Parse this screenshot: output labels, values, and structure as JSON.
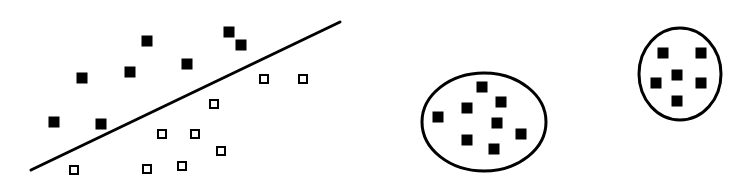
{
  "diagram": {
    "type": "classification-vs-clustering",
    "colors": {
      "stroke": "#000000",
      "fill": "#000000",
      "background": "#ffffff"
    },
    "square_size": 11,
    "hollow_square_size": 10,
    "classification": {
      "separator_line": {
        "x1": 31,
        "y1": 170,
        "x2": 340,
        "y2": 22,
        "stroke_width": 3
      },
      "filled_points": [
        [
          147,
          41
        ],
        [
          229,
          32
        ],
        [
          241,
          45
        ],
        [
          82,
          78
        ],
        [
          130,
          72
        ],
        [
          187,
          64
        ],
        [
          54,
          122
        ],
        [
          101,
          124
        ]
      ],
      "hollow_points": [
        [
          264,
          79
        ],
        [
          303,
          79
        ],
        [
          214,
          104
        ],
        [
          162,
          134
        ],
        [
          195,
          134
        ],
        [
          221,
          151
        ],
        [
          74,
          170
        ],
        [
          147,
          169
        ],
        [
          182,
          166
        ]
      ]
    },
    "clusters": [
      {
        "ellipse": {
          "cx": 484,
          "cy": 122,
          "rx": 62,
          "ry": 49,
          "stroke_width": 3
        },
        "points": [
          [
            482,
            87
          ],
          [
            501,
            102
          ],
          [
            467,
            108
          ],
          [
            438,
            117
          ],
          [
            497,
            123
          ],
          [
            521,
            134
          ],
          [
            467,
            140
          ],
          [
            494,
            149
          ]
        ]
      },
      {
        "ellipse": {
          "cx": 680,
          "cy": 74,
          "rx": 41,
          "ry": 46,
          "stroke_width": 3
        },
        "points": [
          [
            663,
            53
          ],
          [
            701,
            53
          ],
          [
            677,
            75
          ],
          [
            656,
            83
          ],
          [
            701,
            83
          ],
          [
            677,
            101
          ]
        ]
      }
    ]
  }
}
